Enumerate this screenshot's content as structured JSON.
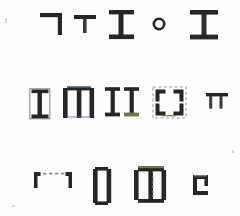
{
  "sheet": {
    "title": "Structural glyph sheet",
    "background_color": "#fdfdfd",
    "ink_color": "#262626",
    "ink_color_soft": "#3a3a3a",
    "dash_color": "#8c8c8c",
    "accent_olive": "#6f7a4a",
    "accent_slate": "#6d7490",
    "width": 240,
    "height": 216,
    "row_count": 3,
    "glyph_count": 14
  },
  "rows": [
    {
      "name": "row-1",
      "label": "Row 1",
      "y": 12,
      "glyphs": [
        {
          "name": "corner-bracket-top-right",
          "label": "Corner bracket",
          "x": 40,
          "y": 13,
          "w": 22,
          "h": 22,
          "type": "corner-tr"
        },
        {
          "name": "tee-small",
          "label": "Tee small",
          "x": 74,
          "y": 15,
          "w": 22,
          "h": 18,
          "type": "tee"
        },
        {
          "name": "i-beam-narrow",
          "label": "I-beam narrow",
          "x": 108,
          "y": 10,
          "w": 26,
          "h": 28,
          "type": "ibeam"
        },
        {
          "name": "ring-dot",
          "label": "Ring",
          "x": 152,
          "y": 17,
          "w": 13,
          "h": 13,
          "type": "ring"
        },
        {
          "name": "i-beam-wide",
          "label": "I-beam wide",
          "x": 190,
          "y": 10,
          "w": 28,
          "h": 28,
          "type": "ibeam"
        }
      ]
    },
    {
      "name": "row-2",
      "label": "Row 2",
      "y": 86,
      "glyphs": [
        {
          "name": "boxed-i-beam",
          "label": "Boxed I-beam",
          "x": 29,
          "y": 88,
          "w": 22,
          "h": 30,
          "type": "boxed-ibeam"
        },
        {
          "name": "double-bracket-joined",
          "label": "Double bracket joined",
          "x": 63,
          "y": 86,
          "w": 30,
          "h": 33,
          "type": "bracket-pair"
        },
        {
          "name": "twin-i-beams",
          "label": "Twin I-beams",
          "x": 105,
          "y": 86,
          "w": 33,
          "h": 33,
          "type": "twin-ibeam"
        },
        {
          "name": "dashed-corner-box",
          "label": "Dashed corner box",
          "x": 152,
          "y": 86,
          "w": 34,
          "h": 33,
          "type": "corner-box"
        },
        {
          "name": "double-tee-small",
          "label": "Double tee",
          "x": 206,
          "y": 93,
          "w": 22,
          "h": 16,
          "type": "double-tee"
        }
      ]
    },
    {
      "name": "row-3",
      "label": "Row 3",
      "y": 168,
      "glyphs": [
        {
          "name": "open-channel-dashed",
          "label": "Open channel dashed",
          "x": 33,
          "y": 172,
          "w": 40,
          "h": 20,
          "type": "open-channel"
        },
        {
          "name": "bracket-pair-tall",
          "label": "Bracket pair tall",
          "x": 93,
          "y": 167,
          "w": 26,
          "h": 38,
          "type": "bracket-pair"
        },
        {
          "name": "i-beam-double-web",
          "label": "I-beam double web",
          "x": 134,
          "y": 165,
          "w": 36,
          "h": 40,
          "type": "double-web-ibeam"
        },
        {
          "name": "small-open-square",
          "label": "Small open square",
          "x": 193,
          "y": 175,
          "w": 18,
          "h": 20,
          "type": "open-square"
        }
      ]
    }
  ],
  "specks": [
    {
      "name": "speck-a",
      "x": 5,
      "y": 18,
      "w": 2,
      "h": 5
    },
    {
      "name": "speck-b",
      "x": 232,
      "y": 150,
      "w": 2,
      "h": 3
    },
    {
      "name": "speck-c",
      "x": 12,
      "y": 205,
      "w": 3,
      "h": 2
    }
  ]
}
